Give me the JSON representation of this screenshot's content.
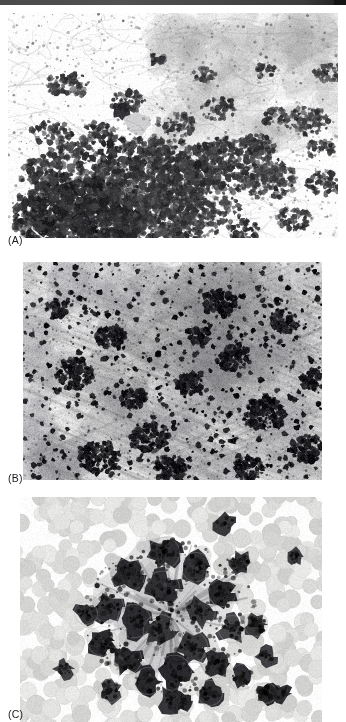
{
  "header": {
    "text": "",
    "bar_color": "#4a4a4a",
    "endcap_color": "#141414"
  },
  "figure": {
    "background_color": "#ffffff",
    "ink_color": "#1a1a1a",
    "panels": [
      {
        "id": "A",
        "label": "(A)",
        "name": "micrograph-panel-a",
        "description": "Low-power grayscale histology micrograph showing a dense dark basophilic cell aggregate occupying the lower-left quadrant, with scattered smaller clumps and wispy pale stroma across the upper and right field.",
        "modality": "brightfield-light-microscopy",
        "stain": "grayscale",
        "dominant_tone": "pale-background-with-dark-clusters"
      },
      {
        "id": "B",
        "label": "(B)",
        "name": "micrograph-panel-b",
        "description": "Higher-power grayscale field with numerous small intensely dark punctate granules scattered over a streaky fibrillar pale-gray background, plus several larger coalescent dark clusters.",
        "modality": "brightfield-light-microscopy",
        "stain": "grayscale",
        "dominant_tone": "mottled-gray-with-black-puncta"
      },
      {
        "id": "C",
        "label": "(C)",
        "name": "micrograph-panel-c",
        "description": "Cytology smear showing a central three-dimensional cluster of large dark-nucleated cells radiating outward, set against a field of uniformly pale round red blood cells.",
        "modality": "brightfield-light-microscopy",
        "stain": "grayscale",
        "dominant_tone": "pale-rbc-field-with-dark-cell-cluster"
      }
    ]
  }
}
